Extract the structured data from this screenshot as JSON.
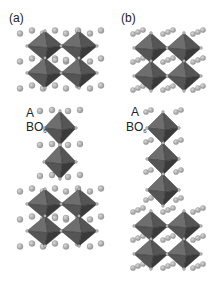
{
  "figure": {
    "panels": [
      {
        "id": "a",
        "label": "(a)",
        "legend": {
          "a_site": "A",
          "b_site_prefix": "BO",
          "b_site_sub": "6"
        }
      },
      {
        "id": "b",
        "label": "(b)",
        "legend": {
          "a_site": "A",
          "b_site_prefix": "BO",
          "b_site_sub": "6"
        }
      }
    ],
    "colors": {
      "octahedron_dark": "#3a3a3a",
      "octahedron_mid": "#555555",
      "octahedron_light": "#6e6e6e",
      "sphere_fill": "#9a9a9a",
      "sphere_highlight": "#d8d8d8",
      "vertex": "#bdbdbd"
    }
  }
}
